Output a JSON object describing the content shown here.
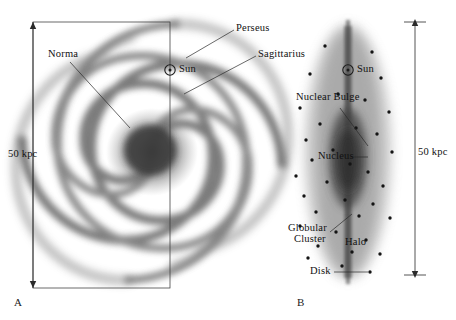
{
  "figure": {
    "type": "astronomy-diagram",
    "background_color": "#ffffff",
    "ink_color": "#1a1a1a"
  },
  "panels": [
    {
      "letter": "A",
      "view": "face-on spiral galaxy",
      "scale_label": "50 kpc",
      "labels": [
        {
          "name": "norma",
          "text": "Norma"
        },
        {
          "name": "perseus",
          "text": "Perseus"
        },
        {
          "name": "sagittarius",
          "text": "Sagittarius"
        },
        {
          "name": "sun",
          "text": "Sun"
        }
      ]
    },
    {
      "letter": "B",
      "view": "edge-on galaxy",
      "scale_label": "50 kpc",
      "labels": [
        {
          "name": "sun",
          "text": "Sun"
        },
        {
          "name": "nuclear-bulge",
          "text": "Nuclear Bulge"
        },
        {
          "name": "nucleus",
          "text": "Nucleus"
        },
        {
          "name": "globular-cluster",
          "text": "Globular\nCluster",
          "line1": "Globular",
          "line2": "Cluster"
        },
        {
          "name": "halo",
          "text": "Halo"
        },
        {
          "name": "disk",
          "text": "Disk"
        }
      ]
    }
  ],
  "panel_a": {
    "letter": "A",
    "scale_label": "50 kpc",
    "norma": "Norma",
    "perseus": "Perseus",
    "sagittarius": "Sagittarius",
    "sun": "Sun",
    "sun_symbol": "☉"
  },
  "panel_b": {
    "letter": "B",
    "scale_label": "50 kpc",
    "sun": "Sun",
    "sun_symbol": "☉",
    "nuclear_bulge": "Nuclear Bulge",
    "nucleus": "Nucleus",
    "globular_cluster_line1": "Globular",
    "globular_cluster_line2": "Cluster",
    "halo": "Halo",
    "disk": "Disk"
  },
  "chart_data": {
    "type": "diagram",
    "title": "",
    "panel_a_geometry": {
      "center": [
        152,
        152
      ],
      "spiral_outer_radius": 120,
      "arm_count": 4,
      "sun_position": [
        170,
        70
      ],
      "rect": {
        "x": 33,
        "y": 22,
        "width": 137,
        "height": 266
      }
    },
    "panel_b_geometry": {
      "center": [
        348,
        152
      ],
      "disk_half_height": 130,
      "disk_half_width": 46,
      "bulge_rx": 18,
      "bulge_ry": 48,
      "sun_position": [
        348,
        70
      ]
    },
    "globular_clusters_b": [
      [
        325,
        46
      ],
      [
        372,
        52
      ],
      [
        310,
        74
      ],
      [
        381,
        78
      ],
      [
        338,
        94
      ],
      [
        365,
        100
      ],
      [
        300,
        108
      ],
      [
        389,
        112
      ],
      [
        320,
        124
      ],
      [
        356,
        128
      ],
      [
        377,
        134
      ],
      [
        306,
        140
      ],
      [
        333,
        150
      ],
      [
        392,
        152
      ],
      [
        312,
        160
      ],
      [
        350,
        164
      ],
      [
        368,
        172
      ],
      [
        296,
        176
      ],
      [
        327,
        182
      ],
      [
        383,
        186
      ],
      [
        304,
        196
      ],
      [
        345,
        200
      ],
      [
        373,
        204
      ],
      [
        316,
        212
      ],
      [
        359,
        216
      ],
      [
        390,
        218
      ],
      [
        300,
        226
      ],
      [
        336,
        232
      ],
      [
        366,
        240
      ],
      [
        318,
        246
      ],
      [
        352,
        252
      ],
      [
        380,
        254
      ],
      [
        308,
        258
      ],
      [
        342,
        266
      ],
      [
        370,
        272
      ]
    ]
  }
}
